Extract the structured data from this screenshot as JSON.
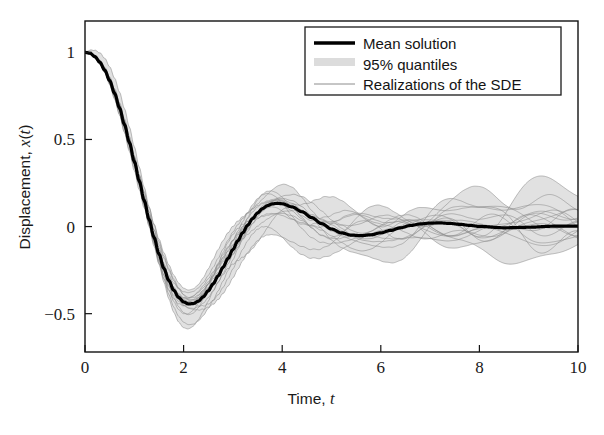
{
  "figure": {
    "background_color": "#ffffff",
    "frame_color": "#121212"
  },
  "chart_data": {
    "type": "line",
    "title": "",
    "xlabel_plain": "Time, ",
    "xlabel_italic": "t",
    "ylabel_plain": "Displacement, ",
    "ylabel_italic_x": "x",
    "ylabel_italic_t": "t",
    "xlim": [
      0,
      10
    ],
    "ylim": [
      -0.72,
      1.18
    ],
    "xticks": [
      0,
      2,
      4,
      6,
      8,
      10
    ],
    "xtick_labels": [
      "0",
      "2",
      "4",
      "6",
      "8",
      "10"
    ],
    "yticks": [
      -0.5,
      0,
      0.5,
      1
    ],
    "ytick_labels": [
      "−0.5",
      "0",
      "0.5",
      "1"
    ],
    "grid": false,
    "legend_position": "upper right",
    "colors": {
      "mean": "#000000",
      "quantiles": "#d9d9d9",
      "realizations": "#8c8c8c"
    },
    "series": [
      {
        "name": "Mean solution",
        "style": "thick-black-line",
        "linewidth": 3.2,
        "color": "#000000",
        "x": [
          0,
          0.1,
          0.2,
          0.3,
          0.4,
          0.5,
          0.6,
          0.7,
          0.8,
          0.9,
          1,
          1.1,
          1.2,
          1.3,
          1.4,
          1.5,
          1.6,
          1.7,
          1.8,
          1.9,
          2,
          2.1,
          2.2,
          2.3,
          2.4,
          2.5,
          2.6,
          2.7,
          2.8,
          2.9,
          3,
          3.1,
          3.2,
          3.3,
          3.4,
          3.5,
          3.6,
          3.7,
          3.8,
          3.9,
          4,
          4.2,
          4.4,
          4.6,
          4.8,
          5,
          5.2,
          5.4,
          5.6,
          5.8,
          6,
          6.2,
          6.4,
          6.6,
          6.8,
          7,
          7.2,
          7.4,
          7.6,
          7.8,
          8,
          8.5,
          9,
          9.5,
          10
        ],
        "y": [
          1,
          0.995,
          0.976,
          0.944,
          0.898,
          0.838,
          0.765,
          0.681,
          0.586,
          0.483,
          0.374,
          0.262,
          0.15,
          0.041,
          -0.062,
          -0.157,
          -0.24,
          -0.31,
          -0.366,
          -0.407,
          -0.433,
          -0.444,
          -0.442,
          -0.428,
          -0.403,
          -0.369,
          -0.329,
          -0.283,
          -0.234,
          -0.183,
          -0.132,
          -0.082,
          -0.035,
          0.008,
          0.046,
          0.078,
          0.103,
          0.12,
          0.13,
          0.134,
          0.131,
          0.113,
          0.085,
          0.051,
          0.017,
          -0.014,
          -0.036,
          -0.049,
          -0.052,
          -0.047,
          -0.036,
          -0.022,
          -0.007,
          0.006,
          0.015,
          0.02,
          0.021,
          0.018,
          0.013,
          0.007,
          0.001,
          -0.007,
          -0.004,
          0.002,
          0.003
        ]
      },
      {
        "name": "95% quantiles",
        "style": "light-gray-band",
        "color": "#d9d9d9"
      },
      {
        "name": "Realizations of the SDE",
        "style": "thin-gray-lines",
        "linewidth": 0.8,
        "color": "#8c8c8c",
        "count": 16
      }
    ]
  },
  "legend": {
    "entries": [
      {
        "label": "Mean solution",
        "swatch": "mean-line-swatch"
      },
      {
        "label": "95% quantiles",
        "swatch": "quantile-band-swatch"
      },
      {
        "label": "Realizations of the SDE",
        "swatch": "realization-line-swatch"
      }
    ]
  }
}
